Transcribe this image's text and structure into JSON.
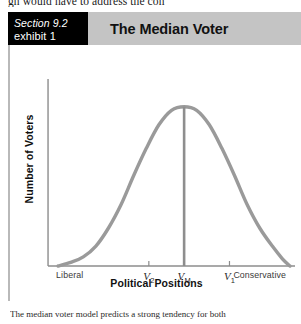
{
  "page": {
    "top_body_text": "gh would have to address the con",
    "bottom_caption": "The median voter model predicts a strong tendency for both"
  },
  "exhibit": {
    "section_number": "Section 9.2",
    "exhibit_number": "exhibit 1",
    "title": "The Median Voter",
    "header_background": "#c4c4c4",
    "section_box_background": "#000000"
  },
  "chart_data": {
    "type": "line",
    "title": "The Median Voter",
    "xlabel": "Political Positions",
    "ylabel": "Number of Voters",
    "grid": false,
    "legend": "none",
    "curve_color": "#9a9a9a",
    "axis_color": "#8c8c8c",
    "median_line_color": "#8e8e8e",
    "xlim": [
      0,
      100
    ],
    "ylim": [
      0,
      100
    ],
    "x_tick_labels": [
      "Liberal",
      "V2",
      "VM",
      "V1",
      "Conservative"
    ],
    "x_ticks": [
      {
        "label": "Liberal",
        "sub": "",
        "x": 6,
        "tick_mark": false
      },
      {
        "label": "V",
        "sub": "2",
        "x": 42,
        "tick_mark": true
      },
      {
        "label": "V",
        "sub": "M",
        "x": 56,
        "tick_mark": true
      },
      {
        "label": "V",
        "sub": "1",
        "x": 74,
        "tick_mark": true
      },
      {
        "label": "Conservative",
        "sub": "",
        "x": 95,
        "tick_mark": false
      }
    ],
    "distribution": "normal",
    "mean_x": 56,
    "peak_y": 88,
    "std_dev": 17,
    "curve_points": [
      {
        "x": 6,
        "y": 0
      },
      {
        "x": 11,
        "y": 2
      },
      {
        "x": 16,
        "y": 5
      },
      {
        "x": 21,
        "y": 11
      },
      {
        "x": 26,
        "y": 21
      },
      {
        "x": 31,
        "y": 34
      },
      {
        "x": 36,
        "y": 50
      },
      {
        "x": 41,
        "y": 65
      },
      {
        "x": 46,
        "y": 78
      },
      {
        "x": 51,
        "y": 86
      },
      {
        "x": 56,
        "y": 88
      },
      {
        "x": 61,
        "y": 86
      },
      {
        "x": 66,
        "y": 78
      },
      {
        "x": 71,
        "y": 65
      },
      {
        "x": 76,
        "y": 50
      },
      {
        "x": 81,
        "y": 34
      },
      {
        "x": 86,
        "y": 21
      },
      {
        "x": 91,
        "y": 11
      },
      {
        "x": 95,
        "y": 4
      },
      {
        "x": 98,
        "y": 0
      }
    ],
    "annotations": [
      {
        "name": "median-vertical-line",
        "x": 56,
        "y_from": 0,
        "y_to": 88
      }
    ]
  }
}
